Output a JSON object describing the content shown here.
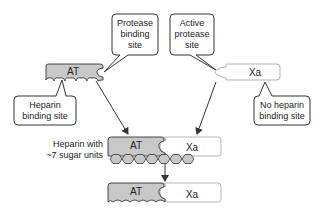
{
  "callouts": {
    "protease_binding": {
      "line1": "Protease",
      "line2": "binding",
      "line3": "site"
    },
    "active_protease": {
      "line1": "Active",
      "line2": "protease",
      "line3": "site"
    },
    "heparin_binding": {
      "line1": "Heparin",
      "line2": "binding site"
    },
    "no_heparin": {
      "line1": "No heparin",
      "line2": "binding site"
    }
  },
  "molecules": {
    "at": "AT",
    "xa": "Xa"
  },
  "heparin_label": {
    "line1": "Heparin with",
    "line2": "~7 sugar units"
  },
  "colors": {
    "at_fill": "#c8c8c8",
    "xa_fill": "#ffffff",
    "hexagon_fill": "#c8c8c8",
    "stroke": "#333333",
    "arrow": "#333333"
  }
}
